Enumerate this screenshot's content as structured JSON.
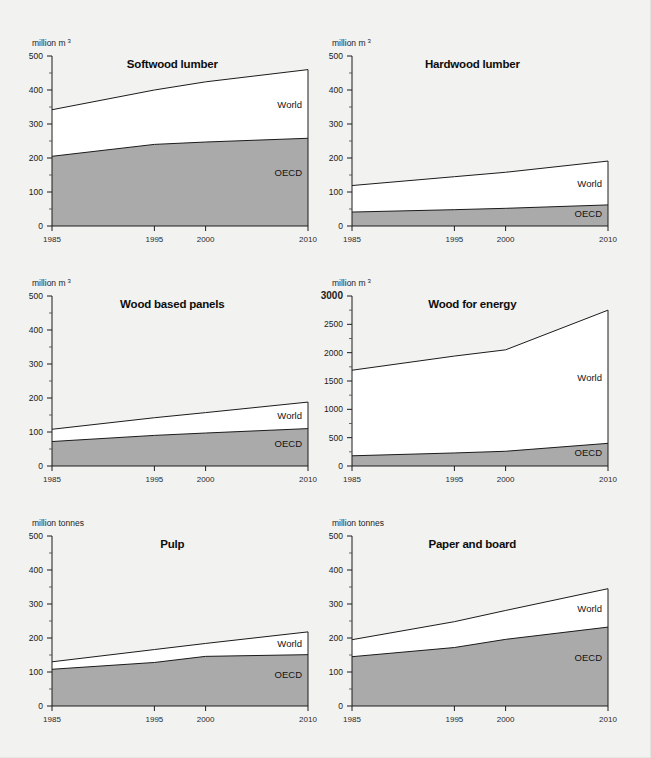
{
  "figure": {
    "background": "#f2f2f0",
    "fill_world": "#ffffff",
    "fill_oecd": "#aaaaaa",
    "line_color": "#1b1b1b",
    "columns": 2,
    "rows": 3
  },
  "chart_data": [
    {
      "type": "area",
      "id": "softwood-lumber",
      "title": "Softwood lumber",
      "ylabel": "million m",
      "ylabel_sup": "3",
      "xlabel": "",
      "xlim": [
        1985,
        2010
      ],
      "ylim": [
        0,
        500
      ],
      "yticks": [
        0,
        100,
        200,
        300,
        400,
        500
      ],
      "ytick_labels": [
        "0",
        "100",
        "200",
        "300",
        "400",
        "500"
      ],
      "yminor_step": 50,
      "xticks": [
        1985,
        1995,
        2000,
        2010
      ],
      "xtick_labels": [
        "1985",
        "1995",
        "2000",
        "2010"
      ],
      "grid": false,
      "legend_position": "inline-right",
      "x": [
        1985,
        1995,
        2000,
        2010
      ],
      "series": [
        {
          "name": "World",
          "values": [
            342,
            400,
            424,
            460
          ]
        },
        {
          "name": "OECD",
          "values": [
            205,
            240,
            247,
            258
          ]
        }
      ]
    },
    {
      "type": "area",
      "id": "hardwood-lumber",
      "title": "Hardwood lumber",
      "ylabel": "million m",
      "ylabel_sup": "3",
      "xlabel": "",
      "xlim": [
        1985,
        2010
      ],
      "ylim": [
        0,
        500
      ],
      "yticks": [
        0,
        100,
        200,
        300,
        400,
        500
      ],
      "ytick_labels": [
        "0",
        "100",
        "200",
        "300",
        "400",
        "500"
      ],
      "yminor_step": 50,
      "xticks": [
        1985,
        1995,
        2000,
        2010
      ],
      "xtick_labels": [
        "1985",
        "1995",
        "2000",
        "2010"
      ],
      "grid": false,
      "legend_position": "inline-right",
      "x": [
        1985,
        1995,
        2000,
        2010
      ],
      "series": [
        {
          "name": "World",
          "values": [
            119,
            145,
            158,
            191
          ]
        },
        {
          "name": "OECD",
          "values": [
            41,
            48,
            52,
            62
          ]
        }
      ]
    },
    {
      "type": "area",
      "id": "wood-based-panels",
      "title": "Wood based panels",
      "ylabel": "million m",
      "ylabel_sup": "3",
      "xlabel": "",
      "xlim": [
        1985,
        2010
      ],
      "ylim": [
        0,
        500
      ],
      "yticks": [
        0,
        100,
        200,
        300,
        400,
        500
      ],
      "ytick_labels": [
        "0",
        "100",
        "200",
        "300",
        "400",
        "500"
      ],
      "yminor_step": 50,
      "xticks": [
        1985,
        1995,
        2000,
        2010
      ],
      "xtick_labels": [
        "1985",
        "1995",
        "2000",
        "2010"
      ],
      "grid": false,
      "legend_position": "inline-right",
      "x": [
        1985,
        1995,
        2000,
        2010
      ],
      "series": [
        {
          "name": "World",
          "values": [
            108,
            142,
            157,
            188
          ]
        },
        {
          "name": "OECD",
          "values": [
            72,
            90,
            97,
            110
          ]
        }
      ]
    },
    {
      "type": "area",
      "id": "wood-for-energy",
      "title": "Wood for energy",
      "ylabel": "million m",
      "ylabel_sup": "3",
      "xlabel": "",
      "xlim": [
        1985,
        2010
      ],
      "ylim": [
        0,
        3000
      ],
      "yticks": [
        0,
        500,
        1000,
        1500,
        2000,
        2500,
        3000
      ],
      "ytick_labels": [
        "0",
        "500",
        "1000",
        "1500",
        "2000",
        "2500",
        "3000"
      ],
      "yminor_step": 250,
      "xticks": [
        1985,
        1995,
        2000,
        2010
      ],
      "xtick_labels": [
        "1985",
        "1995",
        "2000",
        "2010"
      ],
      "grid": false,
      "legend_position": "inline-right",
      "x": [
        1985,
        1995,
        2000,
        2010
      ],
      "series": [
        {
          "name": "World",
          "values": [
            1690,
            1940,
            2050,
            2750
          ]
        },
        {
          "name": "OECD",
          "values": [
            180,
            230,
            260,
            400
          ]
        }
      ]
    },
    {
      "type": "area",
      "id": "pulp",
      "title": "Pulp",
      "ylabel": "million tonnes",
      "ylabel_sup": "",
      "xlabel": "",
      "xlim": [
        1985,
        2010
      ],
      "ylim": [
        0,
        500
      ],
      "yticks": [
        0,
        100,
        200,
        300,
        400,
        500
      ],
      "ytick_labels": [
        "0",
        "100",
        "200",
        "300",
        "400",
        "500"
      ],
      "yminor_step": 50,
      "xticks": [
        1985,
        1995,
        2000,
        2010
      ],
      "xtick_labels": [
        "1985",
        "1995",
        "2000",
        "2010"
      ],
      "grid": false,
      "legend_position": "inline-right",
      "x": [
        1985,
        1995,
        2000,
        2010
      ],
      "series": [
        {
          "name": "World",
          "values": [
            130,
            166,
            184,
            218
          ]
        },
        {
          "name": "OECD",
          "values": [
            108,
            128,
            146,
            151
          ]
        }
      ]
    },
    {
      "type": "area",
      "id": "paper-and-board",
      "title": "Paper and board",
      "ylabel": "million tonnes",
      "ylabel_sup": "",
      "xlabel": "",
      "xlim": [
        1985,
        2010
      ],
      "ylim": [
        0,
        500
      ],
      "yticks": [
        0,
        100,
        200,
        300,
        400,
        500
      ],
      "ytick_labels": [
        "0",
        "100",
        "200",
        "300",
        "400",
        "500"
      ],
      "yminor_step": 50,
      "xticks": [
        1985,
        1995,
        2000,
        2010
      ],
      "xtick_labels": [
        "1985",
        "1995",
        "2000",
        "2010"
      ],
      "grid": false,
      "legend_position": "inline-right",
      "x": [
        1985,
        1995,
        2000,
        2010
      ],
      "series": [
        {
          "name": "World",
          "values": [
            195,
            248,
            281,
            345
          ]
        },
        {
          "name": "OECD",
          "values": [
            145,
            172,
            196,
            232
          ]
        }
      ]
    }
  ]
}
